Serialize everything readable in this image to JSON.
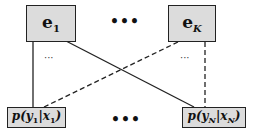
{
  "experts": [
    {
      "symbol": "e",
      "subscript": "1"
    },
    {
      "symbol": "e",
      "subscript": "K"
    }
  ],
  "outputs": [
    {
      "prefix": "p(y",
      "sub_y": "1",
      "mid": "|x",
      "sub_x": "1",
      "suffix": ")"
    },
    {
      "prefix": "p(y",
      "sub_y": "N",
      "mid": "|x",
      "sub_x": "N",
      "suffix": ")"
    }
  ],
  "ellipsis_top": "•••",
  "ellipsis_bottom": "•••",
  "ellipsis_left": "···",
  "ellipsis_right": "···",
  "colors": {
    "box_fill": "#dcdcdc",
    "border": "#222222",
    "line": "#222222"
  }
}
